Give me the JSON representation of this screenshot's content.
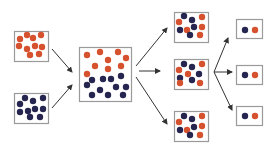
{
  "diagram": {
    "title": "",
    "colors": {
      "red_particle": "#d6512e",
      "blue_particle": "#262550",
      "box_border": "#9a9a9a",
      "arrow": "#333333",
      "background": "#ffffff"
    },
    "boxes": [
      {
        "id": "source-red",
        "x": 14,
        "y": 31,
        "w": 34,
        "h": 30,
        "dots": [
          [
            20,
            39,
            "r"
          ],
          [
            27,
            35,
            "r"
          ],
          [
            33,
            38,
            "r"
          ],
          [
            41,
            35,
            "r"
          ],
          [
            19,
            46,
            "r"
          ],
          [
            27,
            49,
            "r"
          ],
          [
            35,
            46,
            "r"
          ],
          [
            42,
            47,
            "r"
          ],
          [
            30,
            55,
            "r"
          ],
          [
            39,
            54,
            "r"
          ]
        ]
      },
      {
        "id": "source-blue",
        "x": 14,
        "y": 93,
        "w": 34,
        "h": 30,
        "dots": [
          [
            25,
            98,
            "b"
          ],
          [
            33,
            101,
            "b"
          ],
          [
            43,
            98,
            "b"
          ],
          [
            20,
            104,
            "b"
          ],
          [
            28,
            111,
            "b"
          ],
          [
            35,
            109,
            "b"
          ],
          [
            43,
            109,
            "b"
          ],
          [
            20,
            112,
            "b"
          ],
          [
            30,
            117,
            "b"
          ],
          [
            40,
            117,
            "b"
          ]
        ]
      },
      {
        "id": "mixed",
        "x": 79,
        "y": 47,
        "w": 52,
        "h": 54,
        "dots": [
          [
            87,
            55,
            "r"
          ],
          [
            100,
            52,
            "r"
          ],
          [
            118,
            52,
            "r"
          ],
          [
            126,
            58,
            "r"
          ],
          [
            108,
            60,
            "r"
          ],
          [
            95,
            66,
            "r"
          ],
          [
            108,
            69,
            "r"
          ],
          [
            121,
            66,
            "r"
          ],
          [
            87,
            74,
            "r"
          ],
          [
            92,
            80,
            "b"
          ],
          [
            103,
            79,
            "b"
          ],
          [
            111,
            79,
            "b"
          ],
          [
            121,
            76,
            "b"
          ],
          [
            87,
            85,
            "b"
          ],
          [
            100,
            90,
            "b"
          ],
          [
            116,
            87,
            "b"
          ],
          [
            126,
            87,
            "b"
          ],
          [
            92,
            95,
            "b"
          ],
          [
            108,
            95,
            "b"
          ],
          [
            123,
            95,
            "b"
          ]
        ]
      },
      {
        "id": "sample-1",
        "x": 174,
        "y": 12,
        "w": 34,
        "h": 30,
        "dots": [
          [
            184,
            16,
            "b"
          ],
          [
            192,
            20,
            "b"
          ],
          [
            202,
            17,
            "r"
          ],
          [
            179,
            22,
            "r"
          ],
          [
            194,
            27,
            "b"
          ],
          [
            202,
            27,
            "r"
          ],
          [
            180,
            30,
            "b"
          ],
          [
            187,
            30,
            "r"
          ],
          [
            190,
            35,
            "b"
          ],
          [
            200,
            35,
            "r"
          ]
        ]
      },
      {
        "id": "sample-2",
        "x": 174,
        "y": 59,
        "w": 34,
        "h": 30,
        "dots": [
          [
            184,
            64,
            "b"
          ],
          [
            192,
            67,
            "b"
          ],
          [
            202,
            64,
            "r"
          ],
          [
            179,
            70,
            "r"
          ],
          [
            188,
            74,
            "r"
          ],
          [
            199,
            74,
            "b"
          ],
          [
            180,
            78,
            "b"
          ],
          [
            192,
            80,
            "b"
          ],
          [
            200,
            83,
            "r"
          ],
          [
            180,
            83,
            "r"
          ]
        ]
      },
      {
        "id": "sample-3",
        "x": 174,
        "y": 111,
        "w": 34,
        "h": 30,
        "dots": [
          [
            184,
            116,
            "b"
          ],
          [
            192,
            119,
            "b"
          ],
          [
            202,
            116,
            "r"
          ],
          [
            179,
            122,
            "r"
          ],
          [
            194,
            127,
            "b"
          ],
          [
            202,
            126,
            "r"
          ],
          [
            180,
            130,
            "b"
          ],
          [
            187,
            130,
            "r"
          ],
          [
            190,
            135,
            "b"
          ],
          [
            200,
            135,
            "r"
          ]
        ]
      },
      {
        "id": "pair-1",
        "x": 236,
        "y": 19,
        "w": 26,
        "h": 19,
        "dots": [
          [
            245,
            30,
            "b"
          ],
          [
            255,
            30,
            "r"
          ]
        ]
      },
      {
        "id": "pair-2",
        "x": 236,
        "y": 65,
        "w": 26,
        "h": 19,
        "dots": [
          [
            245,
            75,
            "b"
          ],
          [
            255,
            75,
            "r"
          ]
        ]
      },
      {
        "id": "pair-3",
        "x": 236,
        "y": 106,
        "w": 26,
        "h": 19,
        "dots": [
          [
            245,
            116,
            "b"
          ],
          [
            255,
            116,
            "r"
          ]
        ]
      }
    ],
    "arrows": [
      {
        "id": "red-to-mixed",
        "x1": 52,
        "y1": 49,
        "x2": 72,
        "y2": 72
      },
      {
        "id": "blue-to-mixed",
        "x1": 52,
        "y1": 108,
        "x2": 72,
        "y2": 85
      },
      {
        "id": "mixed-to-sample-1",
        "x1": 136,
        "y1": 66,
        "x2": 167,
        "y2": 28
      },
      {
        "id": "mixed-to-sample-2",
        "x1": 139,
        "y1": 71,
        "x2": 160,
        "y2": 71
      },
      {
        "id": "mixed-to-sample-3",
        "x1": 136,
        "y1": 77,
        "x2": 167,
        "y2": 124
      },
      {
        "id": "sample-2-to-pair-1",
        "x1": 214,
        "y1": 72,
        "x2": 228,
        "y2": 38
      },
      {
        "id": "sample-2-to-pair-2",
        "x1": 214,
        "y1": 72,
        "x2": 232,
        "y2": 72
      },
      {
        "id": "sample-2-to-pair-3",
        "x1": 214,
        "y1": 72,
        "x2": 232,
        "y2": 110
      }
    ],
    "dot_radius": 3.2
  }
}
